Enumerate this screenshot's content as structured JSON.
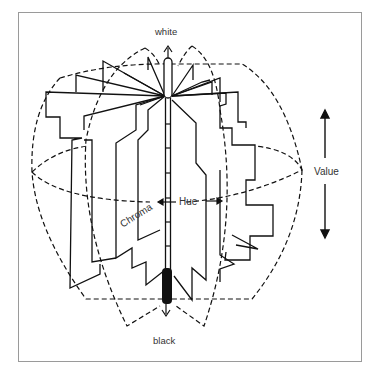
{
  "diagram": {
    "labels": {
      "top": "white",
      "bottom": "black",
      "vertical_dimension": "Value",
      "circumferential_dimension": "Hue",
      "radial_dimension": "Chroma"
    },
    "colors": {
      "line": "#111111",
      "frame": "#9a9a9a",
      "text": "#333333",
      "background": "#ffffff"
    }
  }
}
